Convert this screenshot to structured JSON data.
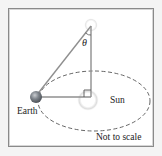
{
  "diagram": {
    "labels": {
      "angle": "θ",
      "earth": "Earth",
      "sun": "Sun",
      "note": "Not to scale"
    },
    "colors": {
      "line": "#8f8f8f",
      "orbit": "#555555",
      "earth": "#7a7f86",
      "glow": "#d8d8d8",
      "text": "#222222",
      "frame": "#8a8a8a"
    }
  }
}
